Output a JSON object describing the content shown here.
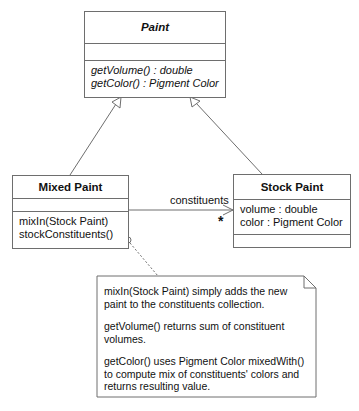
{
  "diagram": {
    "type": "UML class diagram",
    "classes": {
      "paint": {
        "name": "Paint",
        "abstract": true,
        "attributes": [],
        "operations": [
          "getVolume() : double",
          "getColor() : Pigment Color"
        ]
      },
      "mixed_paint": {
        "name": "Mixed Paint",
        "attributes": [],
        "operations": [
          "mixIn(Stock Paint)",
          "stockConstituents()"
        ]
      },
      "stock_paint": {
        "name": "Stock Paint",
        "attributes": [
          "volume : double",
          "color : Pigment Color"
        ],
        "operations": []
      }
    },
    "relationships": [
      {
        "type": "generalization",
        "from": "Mixed Paint",
        "to": "Paint"
      },
      {
        "type": "generalization",
        "from": "Stock Paint",
        "to": "Paint"
      },
      {
        "type": "association",
        "from": "Mixed Paint",
        "to": "Stock Paint",
        "role": "constituents",
        "multiplicity": "*",
        "navigable": true
      }
    ],
    "association": {
      "role": "constituents",
      "multiplicity": "*"
    },
    "note": {
      "attached_to": "Mixed Paint",
      "paragraphs": [
        "mixIn(Stock Paint) simply adds the new paint to the constituents collection.",
        "getVolume() returns sum of constituent volumes.",
        "getColor() uses Pigment Color mixedWith() to compute mix of constituents' colors and returns resulting value."
      ]
    },
    "colors": {
      "line": "#6e6e6e",
      "text": "#111111",
      "background": "#ffffff"
    }
  }
}
